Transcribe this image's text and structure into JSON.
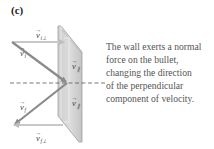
{
  "panel": {
    "label": "(c)"
  },
  "caption": {
    "lines": [
      "The wall exerts a normal",
      "force on the bullet,",
      "changing the direction",
      "of the perpendicular",
      "component of velocity."
    ]
  },
  "vectors": {
    "v_i": {
      "symbol": "v",
      "subscript": "i",
      "label": "v⃗ i"
    },
    "v_i_perp": {
      "symbol": "v",
      "subscript": "i⊥",
      "label": "v⃗ i⊥"
    },
    "v_f": {
      "symbol": "v",
      "subscript": "f",
      "label": "v⃗ f"
    },
    "v_f_perp": {
      "symbol": "v",
      "subscript": "f⊥",
      "label": "v⃗ f⊥"
    },
    "v_parallel_top": {
      "symbol": "v",
      "subscript": "∥",
      "label": "v⃗ ∥"
    },
    "v_parallel_bottom": {
      "symbol": "v",
      "subscript": "∥",
      "label": "v⃗ ∥"
    }
  },
  "colors": {
    "arrow": "#8a8a8a",
    "arrow_light": "#c8c8c8",
    "wall_fill": "#d6d6d6",
    "wall_edge": "#9a9a9a",
    "dashed_line": "#555555",
    "caption_text": "#555555"
  }
}
